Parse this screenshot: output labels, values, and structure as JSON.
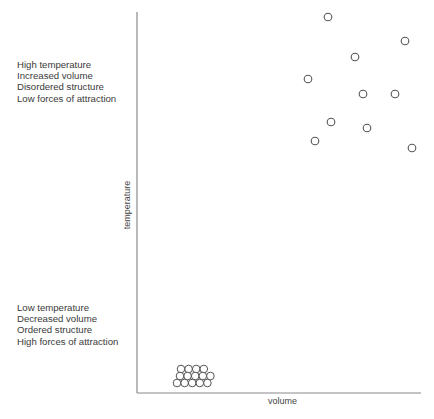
{
  "diagram": {
    "type": "states-of-matter-particle-diagram",
    "axes": {
      "x_label": "volume",
      "y_label": "temperature",
      "color": "#8a8a8a"
    },
    "annotations": {
      "high": {
        "lines": [
          "High temperature",
          "Increased volume",
          "Disordered structure",
          "Low forces of attraction"
        ]
      },
      "low": {
        "lines": [
          "Low temperature",
          "Decreased volume",
          "Ordered structure",
          "High forces of attraction"
        ]
      }
    },
    "particle_color": "#555555",
    "scattered_particles": [
      {
        "x": 328,
        "y": 17
      },
      {
        "x": 405,
        "y": 41
      },
      {
        "x": 355,
        "y": 57
      },
      {
        "x": 308,
        "y": 79
      },
      {
        "x": 363,
        "y": 94
      },
      {
        "x": 395,
        "y": 94
      },
      {
        "x": 331,
        "y": 122
      },
      {
        "x": 367,
        "y": 128
      },
      {
        "x": 315,
        "y": 141
      },
      {
        "x": 412,
        "y": 148
      }
    ],
    "packed_particles": {
      "rows": [
        {
          "count": 4,
          "start_x": 181,
          "y": 369
        },
        {
          "count": 5,
          "start_x": 180,
          "y": 376
        },
        {
          "count": 5,
          "start_x": 177,
          "y": 383
        }
      ],
      "spacing": 7.6,
      "radius": 3.8
    }
  }
}
